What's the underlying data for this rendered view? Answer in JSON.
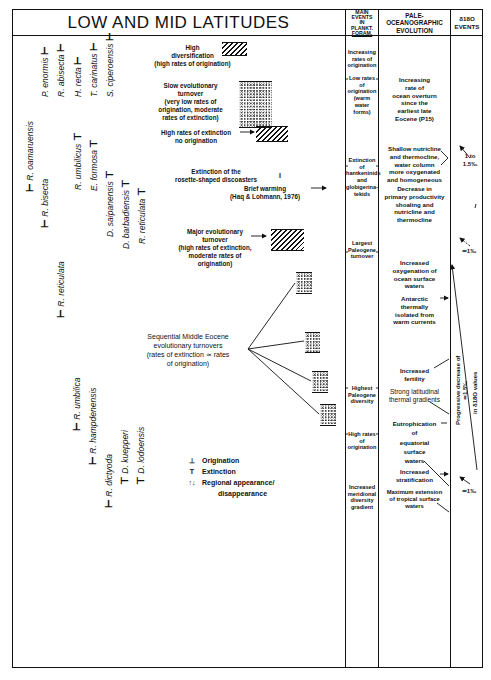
{
  "header": {
    "title": "LOW AND MID LATITUDES",
    "col_events": [
      "MAIN",
      "EVENTS",
      "IN",
      "PLANKT.",
      "FORAM."
    ],
    "col_paleo": [
      "PALE-",
      "OCEANOGRAPHIC",
      "EVOLUTION"
    ],
    "col_d18o": [
      "δ18O",
      "EVENTS"
    ]
  },
  "species": [
    {
      "name": "P. enormis",
      "marker": "origination"
    },
    {
      "name": "R. abisecta",
      "marker": "origination"
    },
    {
      "name": "H. recta",
      "marker": "origination"
    },
    {
      "name": "T. carinatus",
      "marker": "origination"
    },
    {
      "name": "S. ciperoensis",
      "marker": "origination"
    },
    {
      "name": "R. oamaruensis",
      "marker": "origination"
    },
    {
      "name": "R. bisecta",
      "marker": "origination"
    },
    {
      "name": "R. umbilicus",
      "marker": "extinction"
    },
    {
      "name": "E. formosa",
      "marker": "extinction"
    },
    {
      "name": "D. saipanensis",
      "marker": "extinction"
    },
    {
      "name": "D. barbadiensis",
      "marker": "extinction"
    },
    {
      "name": "R. reticulata",
      "marker": "extinction"
    },
    {
      "name": "R. reticulata",
      "marker": "origination"
    },
    {
      "name": "R. umbilica",
      "marker": "origination"
    },
    {
      "name": "R. hampdenensis",
      "marker": "origination"
    },
    {
      "name": "R. dictyoda",
      "marker": "origination"
    },
    {
      "name": "D. kuepperi",
      "marker": "extinction"
    },
    {
      "name": "D. lodoensis",
      "marker": "extinction"
    }
  ],
  "evolution_labels": {
    "high_div": [
      "High",
      "diversification",
      "(high rates of origination)"
    ],
    "slow": [
      "Slow evolutionary",
      "turnover",
      "(very low rates of",
      "origination, moderate",
      "rates of extinction)"
    ],
    "high_ext": [
      "High rates of extinction",
      "no origination"
    ],
    "rosette": [
      "Extinction of the",
      "rosette-shaped discoasters"
    ],
    "warming": [
      "Brief warming",
      "(Haq & Lohmann, 1976)"
    ],
    "major": [
      "Major evolutionary",
      "turnover",
      "(high rates of extinction,",
      "moderate rates of",
      "origination)"
    ],
    "sequential": [
      "Sequential Middle Eocene",
      "evolutionary turnovers",
      "(rates of extinction ≃ rates",
      "of origination)"
    ]
  },
  "legend": [
    {
      "symbol": "⊥",
      "label": "Origination"
    },
    {
      "symbol": "T",
      "label": "Extinction"
    },
    {
      "symbol": "↑↓",
      "label": "Regional appearance/"
    },
    {
      "symbol": "",
      "label": "disappearance"
    }
  ],
  "plankt_events": [
    [
      "Increasing",
      "rates of",
      "origination"
    ],
    [
      "Low rates",
      "of",
      "origination",
      "(warm water",
      "forms)"
    ],
    [
      "Extinction",
      "of",
      "hantkeninids",
      "and",
      "globigerina-",
      "tekids"
    ],
    [
      "Largest",
      "Paleogene",
      "turnover"
    ],
    [
      "Highest",
      "Paleogene",
      "diversity"
    ],
    [
      "High rates",
      "of",
      "origination"
    ],
    [
      "Increased",
      "meridional",
      "diversity",
      "gradient"
    ]
  ],
  "paleo_evolution": [
    [
      "Increasing",
      "rate of",
      "ocean overturn",
      "since the",
      "earliest late",
      "Eocene (P15)"
    ],
    [
      "Shallow nutricline",
      "and thermocline,",
      "water column",
      "more oxygenated",
      "and homogeneous"
    ],
    [
      "Decrease in",
      "primary productivity",
      "shoaling and",
      "nutricline and",
      "thermocline"
    ],
    [
      "Increased",
      "oxygenation of",
      "ocean surface",
      "waters"
    ],
    [
      "Antarctic",
      "thermally",
      "isolated from",
      "warm currents"
    ],
    [
      "Increased",
      "fertility"
    ],
    [
      "Strong latitudinal",
      "thermal gradients"
    ],
    [
      "Eutrophication",
      "of",
      "equatorial",
      "surface",
      "waters"
    ],
    [
      "Increased",
      "stratification"
    ],
    [
      "Maximum extension",
      "of tropical surface",
      "waters"
    ]
  ],
  "d18o_events": {
    "e1": [
      "1 to",
      "1.5‰"
    ],
    "e2": "≃1‰",
    "progressive": [
      "Progressive decrease of",
      "≃1.5‰",
      "in δ18O values"
    ],
    "e3": "≃1‰"
  }
}
